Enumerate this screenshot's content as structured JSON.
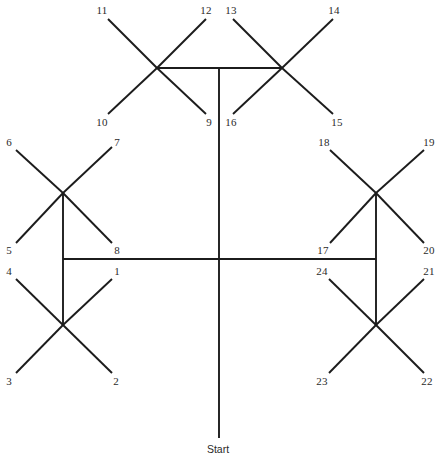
{
  "figure": {
    "name": "radial-arm-maze-diagram",
    "background_color": "#ffffff",
    "line_color": "#1c1c1c",
    "text_color": "#2a2a2a",
    "width": 444,
    "height": 459
  },
  "start": {
    "label": "Start",
    "x": 218,
    "y": 449
  },
  "arm_labels": [
    {
      "id": "1",
      "label": "1",
      "x": 117,
      "y": 271
    },
    {
      "id": "2",
      "label": "2",
      "x": 116,
      "y": 381
    },
    {
      "id": "3",
      "label": "3",
      "x": 9,
      "y": 381
    },
    {
      "id": "4",
      "label": "4",
      "x": 9,
      "y": 271
    },
    {
      "id": "5",
      "label": "5",
      "x": 9,
      "y": 250
    },
    {
      "id": "6",
      "label": "6",
      "x": 9,
      "y": 142
    },
    {
      "id": "7",
      "label": "7",
      "x": 117,
      "y": 142
    },
    {
      "id": "8",
      "label": "8",
      "x": 117,
      "y": 250
    },
    {
      "id": "9",
      "label": "9",
      "x": 209,
      "y": 122
    },
    {
      "id": "10",
      "label": "10",
      "x": 102,
      "y": 122
    },
    {
      "id": "11",
      "label": "11",
      "x": 102,
      "y": 10
    },
    {
      "id": "12",
      "label": "12",
      "x": 206,
      "y": 10
    },
    {
      "id": "13",
      "label": "13",
      "x": 231,
      "y": 10
    },
    {
      "id": "14",
      "label": "14",
      "x": 334,
      "y": 10
    },
    {
      "id": "15",
      "label": "15",
      "x": 337,
      "y": 122
    },
    {
      "id": "16",
      "label": "16",
      "x": 231,
      "y": 122
    },
    {
      "id": "17",
      "label": "17",
      "x": 323,
      "y": 250
    },
    {
      "id": "18",
      "label": "18",
      "x": 324,
      "y": 142
    },
    {
      "id": "19",
      "label": "19",
      "x": 429,
      "y": 142
    },
    {
      "id": "20",
      "label": "20",
      "x": 429,
      "y": 250
    },
    {
      "id": "21",
      "label": "21",
      "x": 429,
      "y": 271
    },
    {
      "id": "22",
      "label": "22",
      "x": 427,
      "y": 381
    },
    {
      "id": "23",
      "label": "23",
      "x": 322,
      "y": 381
    },
    {
      "id": "24",
      "label": "24",
      "x": 322,
      "y": 271
    }
  ],
  "nodes": [
    {
      "id": "node-top-left",
      "x": 157,
      "y": 68
    },
    {
      "id": "node-top-right",
      "x": 282,
      "y": 68
    },
    {
      "id": "node-mid-left",
      "x": 63,
      "y": 193
    },
    {
      "id": "node-mid-right",
      "x": 376,
      "y": 193
    },
    {
      "id": "node-bottom-left",
      "x": 63,
      "y": 325
    },
    {
      "id": "node-bottom-right",
      "x": 376,
      "y": 325
    }
  ],
  "trunk_segments": [
    {
      "id": "trunk-vertical",
      "x1": 219,
      "y1": 68,
      "x2": 219,
      "y2": 438
    },
    {
      "id": "trunk-top-bar",
      "x1": 157,
      "y1": 68,
      "x2": 282,
      "y2": 68
    },
    {
      "id": "trunk-middle-bar",
      "x1": 63,
      "y1": 259,
      "x2": 376,
      "y2": 259
    },
    {
      "id": "trunk-left-riser",
      "x1": 63,
      "y1": 193,
      "x2": 63,
      "y2": 325
    },
    {
      "id": "trunk-right-riser",
      "x1": 376,
      "y1": 193,
      "x2": 376,
      "y2": 325
    }
  ],
  "arm_segments": [
    {
      "id": "arm-11",
      "x1": 157,
      "y1": 68,
      "x2": 108,
      "y2": 19
    },
    {
      "id": "arm-12",
      "x1": 157,
      "y1": 68,
      "x2": 206,
      "y2": 19
    },
    {
      "id": "arm-10",
      "x1": 157,
      "y1": 68,
      "x2": 108,
      "y2": 114
    },
    {
      "id": "arm-9",
      "x1": 157,
      "y1": 68,
      "x2": 206,
      "y2": 114
    },
    {
      "id": "arm-13",
      "x1": 282,
      "y1": 68,
      "x2": 233,
      "y2": 19
    },
    {
      "id": "arm-14",
      "x1": 282,
      "y1": 68,
      "x2": 333,
      "y2": 19
    },
    {
      "id": "arm-16",
      "x1": 282,
      "y1": 68,
      "x2": 233,
      "y2": 114
    },
    {
      "id": "arm-15",
      "x1": 282,
      "y1": 68,
      "x2": 333,
      "y2": 114
    },
    {
      "id": "arm-6",
      "x1": 63,
      "y1": 193,
      "x2": 16,
      "y2": 150
    },
    {
      "id": "arm-7",
      "x1": 63,
      "y1": 193,
      "x2": 112,
      "y2": 147
    },
    {
      "id": "arm-5",
      "x1": 63,
      "y1": 193,
      "x2": 16,
      "y2": 243
    },
    {
      "id": "arm-8",
      "x1": 63,
      "y1": 193,
      "x2": 112,
      "y2": 243
    },
    {
      "id": "arm-18",
      "x1": 376,
      "y1": 193,
      "x2": 330,
      "y2": 150
    },
    {
      "id": "arm-19",
      "x1": 376,
      "y1": 193,
      "x2": 424,
      "y2": 150
    },
    {
      "id": "arm-17",
      "x1": 376,
      "y1": 193,
      "x2": 330,
      "y2": 243
    },
    {
      "id": "arm-20",
      "x1": 376,
      "y1": 193,
      "x2": 424,
      "y2": 243
    },
    {
      "id": "arm-4",
      "x1": 63,
      "y1": 325,
      "x2": 16,
      "y2": 279
    },
    {
      "id": "arm-1",
      "x1": 63,
      "y1": 325,
      "x2": 112,
      "y2": 279
    },
    {
      "id": "arm-3",
      "x1": 63,
      "y1": 325,
      "x2": 16,
      "y2": 373
    },
    {
      "id": "arm-2",
      "x1": 63,
      "y1": 325,
      "x2": 112,
      "y2": 373
    },
    {
      "id": "arm-24",
      "x1": 376,
      "y1": 325,
      "x2": 329,
      "y2": 279
    },
    {
      "id": "arm-21",
      "x1": 376,
      "y1": 325,
      "x2": 424,
      "y2": 279
    },
    {
      "id": "arm-23",
      "x1": 376,
      "y1": 325,
      "x2": 329,
      "y2": 373
    },
    {
      "id": "arm-22",
      "x1": 376,
      "y1": 325,
      "x2": 424,
      "y2": 373
    }
  ]
}
